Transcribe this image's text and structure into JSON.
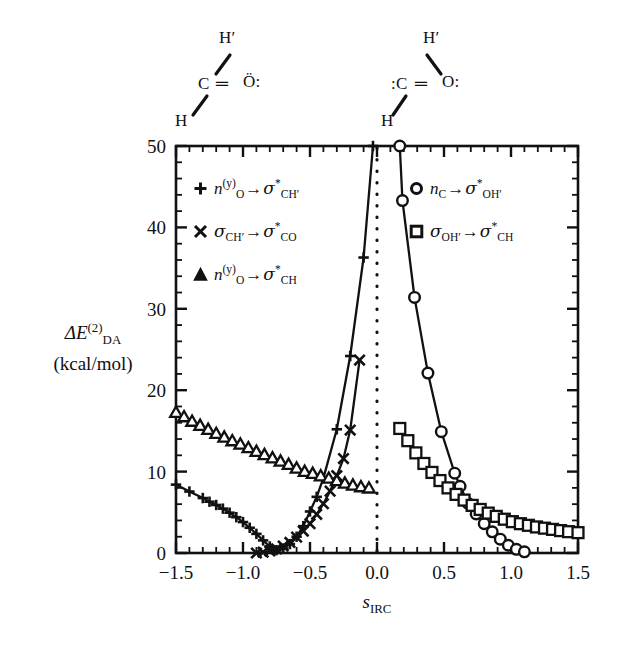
{
  "chart_data": {
    "type": "line",
    "title": "",
    "xlabel": "s_IRC",
    "ylabel": "ΔE_DA^(2) (kcal/mol)",
    "xlim": [
      -1.5,
      1.5
    ],
    "ylim": [
      0,
      50
    ],
    "xticks": [
      "−1.5",
      "−1.0",
      "−0.5",
      "0.0",
      "0.5",
      "1.0",
      "1.5"
    ],
    "xtick_values": [
      -1.5,
      -1.0,
      -0.5,
      0.0,
      0.5,
      1.0,
      1.5
    ],
    "yticks": [
      "0",
      "10",
      "20",
      "30",
      "40",
      "50"
    ],
    "ytick_values": [
      0,
      10,
      20,
      30,
      40,
      50
    ],
    "xminor_step": 0.1,
    "yminor_step": 2,
    "grid": false,
    "legend_position": "inside-top",
    "annotations": [
      {
        "name": "transition-state-marker",
        "type": "vertical-dotted-line",
        "x": 0.0
      }
    ],
    "series": [
      {
        "name": "n_O(y) -> sigma*_CH'",
        "marker": "plus",
        "points": [
          [
            -1.5,
            8.4
          ],
          [
            -1.4,
            7.55
          ],
          [
            -1.3,
            6.75
          ],
          [
            -1.25,
            6.3
          ],
          [
            -1.2,
            5.9
          ],
          [
            -1.15,
            5.45
          ],
          [
            -1.1,
            4.95
          ],
          [
            -1.05,
            4.4
          ],
          [
            -1.0,
            3.8
          ],
          [
            -0.95,
            3.1
          ],
          [
            -0.9,
            2.35
          ],
          [
            -0.85,
            1.55
          ],
          [
            -0.8,
            0.8
          ],
          [
            -0.75,
            0.35
          ],
          [
            -0.7,
            0.55
          ],
          [
            -0.65,
            1.1
          ],
          [
            -0.6,
            2.0
          ],
          [
            -0.55,
            3.3
          ],
          [
            -0.5,
            5.1
          ],
          [
            -0.45,
            6.9
          ],
          [
            -0.4,
            9.2
          ],
          [
            -0.3,
            15.2
          ],
          [
            -0.2,
            24.2
          ],
          [
            -0.1,
            36.3
          ],
          [
            -0.03,
            50.0
          ]
        ]
      },
      {
        "name": "sigma_CH' -> sigma*_CO",
        "marker": "cross",
        "points": [
          [
            -0.9,
            0.0
          ],
          [
            -0.85,
            0.1
          ],
          [
            -0.8,
            0.25
          ],
          [
            -0.75,
            0.5
          ],
          [
            -0.7,
            0.85
          ],
          [
            -0.65,
            1.3
          ],
          [
            -0.6,
            1.95
          ],
          [
            -0.55,
            2.7
          ],
          [
            -0.5,
            3.6
          ],
          [
            -0.45,
            4.75
          ],
          [
            -0.4,
            6.05
          ],
          [
            -0.35,
            7.6
          ],
          [
            -0.3,
            9.5
          ],
          [
            -0.25,
            11.6
          ],
          [
            -0.2,
            15.1
          ],
          [
            -0.13,
            23.7
          ]
        ]
      },
      {
        "name": "n_O(y) -> sigma*_CH",
        "marker": "triangle",
        "points": [
          [
            -1.5,
            17.3
          ],
          [
            -1.44,
            16.75
          ],
          [
            -1.38,
            16.2
          ],
          [
            -1.32,
            15.7
          ],
          [
            -1.26,
            15.2
          ],
          [
            -1.2,
            14.7
          ],
          [
            -1.14,
            14.25
          ],
          [
            -1.08,
            13.8
          ],
          [
            -1.02,
            13.4
          ],
          [
            -0.96,
            12.95
          ],
          [
            -0.9,
            12.5
          ],
          [
            -0.84,
            12.1
          ],
          [
            -0.78,
            11.7
          ],
          [
            -0.72,
            11.3
          ],
          [
            -0.66,
            10.9
          ],
          [
            -0.6,
            10.45
          ],
          [
            -0.54,
            10.05
          ],
          [
            -0.48,
            9.8
          ],
          [
            -0.42,
            9.5
          ],
          [
            -0.36,
            9.2
          ],
          [
            -0.3,
            8.9
          ],
          [
            -0.24,
            8.6
          ],
          [
            -0.18,
            8.35
          ],
          [
            -0.12,
            8.15
          ],
          [
            -0.06,
            8.0
          ]
        ]
      },
      {
        "name": "n_C -> sigma*_OH'",
        "marker": "circle",
        "points": [
          [
            0.17,
            50.0
          ],
          [
            0.19,
            43.3
          ],
          [
            0.28,
            31.4
          ],
          [
            0.38,
            22.1
          ],
          [
            0.48,
            14.9
          ],
          [
            0.58,
            9.8
          ],
          [
            0.62,
            8.2
          ],
          [
            0.68,
            6.1
          ],
          [
            0.74,
            4.8
          ],
          [
            0.8,
            3.6
          ],
          [
            0.86,
            2.6
          ],
          [
            0.92,
            1.7
          ],
          [
            0.98,
            0.95
          ],
          [
            1.04,
            0.45
          ],
          [
            1.1,
            0.15
          ]
        ]
      },
      {
        "name": "sigma_OH' -> sigma*_CH",
        "marker": "square",
        "points": [
          [
            0.17,
            15.3
          ],
          [
            0.23,
            13.8
          ],
          [
            0.29,
            12.3
          ],
          [
            0.35,
            11.0
          ],
          [
            0.41,
            9.9
          ],
          [
            0.47,
            8.9
          ],
          [
            0.53,
            8.0
          ],
          [
            0.59,
            7.2
          ],
          [
            0.65,
            6.5
          ],
          [
            0.71,
            5.85
          ],
          [
            0.77,
            5.35
          ],
          [
            0.83,
            4.9
          ],
          [
            0.89,
            4.5
          ],
          [
            0.95,
            4.15
          ],
          [
            1.01,
            3.85
          ],
          [
            1.07,
            3.6
          ],
          [
            1.13,
            3.4
          ],
          [
            1.19,
            3.2
          ],
          [
            1.25,
            3.05
          ],
          [
            1.31,
            2.9
          ],
          [
            1.37,
            2.75
          ],
          [
            1.43,
            2.62
          ],
          [
            1.5,
            2.5
          ]
        ]
      }
    ]
  },
  "axes": {
    "ylabel_main": "ΔE",
    "ylabel_sub": "DA",
    "ylabel_sup": "(2)",
    "ylabel_units": "(kcal/mol)",
    "xlabel_main": "s",
    "xlabel_sub": "IRC"
  },
  "legend_left": [
    {
      "marker": "plus",
      "donor": "n",
      "donor_sub": "O",
      "donor_sup": "(y)",
      "arrow": "→",
      "acceptor": "σ",
      "acceptor_sup": "*",
      "acceptor_sub": "CH′"
    },
    {
      "marker": "cross",
      "donor": "σ",
      "donor_sub": "CH′",
      "donor_sup": "",
      "arrow": "→",
      "acceptor": "σ",
      "acceptor_sup": "*",
      "acceptor_sub": "CO"
    },
    {
      "marker": "triangle",
      "donor": "n",
      "donor_sub": "O",
      "donor_sup": "(y)",
      "arrow": "→",
      "acceptor": "σ",
      "acceptor_sup": "*",
      "acceptor_sub": "CH"
    }
  ],
  "legend_right": [
    {
      "marker": "circle",
      "donor": "n",
      "donor_sub": "C",
      "donor_sup": "",
      "arrow": "→",
      "acceptor": "σ",
      "acceptor_sup": "*",
      "acceptor_sub": "OH′"
    },
    {
      "marker": "square",
      "donor": "σ",
      "donor_sub": "OH′",
      "donor_sup": "",
      "arrow": "→",
      "acceptor": "σ",
      "acceptor_sup": "*",
      "acceptor_sub": "CH"
    }
  ],
  "structures": {
    "left": {
      "name": "formaldehyde",
      "h_prime": "H′",
      "center": "C",
      "bond": "═",
      "oxygen": "Ö:",
      "h": "H"
    },
    "right": {
      "name": "hydroxycarbene",
      "h_prime": "H′",
      "center": ":C",
      "bond": "═",
      "oxygen": "O:",
      "h": "H"
    }
  },
  "colors": {
    "ink": "#111111",
    "background": "#ffffff"
  }
}
